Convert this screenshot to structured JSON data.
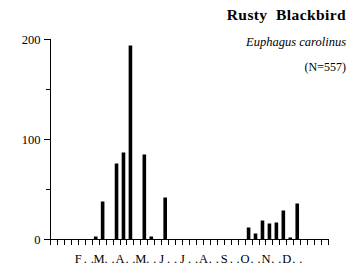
{
  "titles": {
    "common_name": "Rusty  Blackbird",
    "scientific_name": "Euphagus carolinus",
    "sample_size": "(N=557)"
  },
  "chart_data": {
    "type": "bar",
    "title": "Rusty  Blackbird",
    "subtitle": "Euphagus carolinus",
    "annotation": "(N=557)",
    "xlabel": "",
    "ylabel": "",
    "ylim": [
      0,
      200
    ],
    "grid": false,
    "legend": null,
    "y_ticks_major": [
      0,
      100,
      200
    ],
    "y_ticks_minor": [
      50,
      150
    ],
    "y_tick_labels": [
      "0",
      "100",
      "200"
    ],
    "x_tick_labels": [
      "F",
      ".",
      ".",
      "M",
      ".",
      ".",
      "A",
      ".",
      ".",
      "M",
      ".",
      ".",
      "J",
      ".",
      ".",
      "J",
      ".",
      ".",
      "A",
      ".",
      ".",
      "S",
      ".",
      ".",
      "O",
      ".",
      ".",
      "N",
      ".",
      ".",
      "D",
      ".",
      "."
    ],
    "x_axis_note": "months divided into thirds; first label F is at the 4th interval",
    "categories": [
      "Jan-1",
      "Jan-2",
      "Jan-3",
      "Feb-1",
      "Feb-2",
      "Feb-3",
      "Mar-1",
      "Mar-2",
      "Mar-3",
      "Apr-1",
      "Apr-2",
      "Apr-3",
      "May-1",
      "May-2",
      "May-3",
      "Jun-1",
      "Jun-2",
      "Jun-3",
      "Jul-1",
      "Jul-2",
      "Jul-3",
      "Aug-1",
      "Aug-2",
      "Aug-3",
      "Sep-1",
      "Sep-2",
      "Sep-3",
      "Oct-1",
      "Oct-2",
      "Oct-3",
      "Nov-1",
      "Nov-2",
      "Nov-3",
      "Dec-1",
      "Dec-2",
      "Dec-3"
    ],
    "values": [
      0,
      0,
      0,
      0,
      0,
      3,
      38,
      0,
      76,
      87,
      194,
      0,
      85,
      3,
      0,
      42,
      0,
      0,
      0,
      0,
      0,
      0,
      0,
      0,
      0,
      0,
      0,
      12,
      6,
      19,
      16,
      17,
      29,
      2,
      36,
      0
    ]
  },
  "axis": {
    "y_label_200": "200",
    "y_label_100": "100",
    "y_label_0": "0"
  }
}
